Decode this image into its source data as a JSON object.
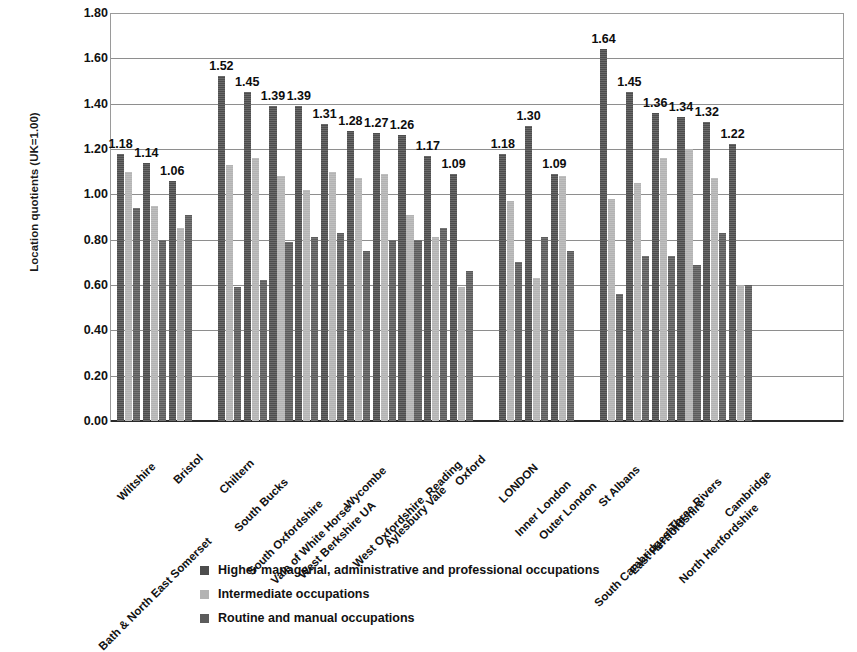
{
  "chart_data": {
    "type": "bar",
    "title": "",
    "xlabel": "",
    "ylabel": "Location quotients (UK=1.00)",
    "ylim": [
      0.0,
      1.8
    ],
    "ytick_labels": [
      "0.00",
      "0.20",
      "0.40",
      "0.60",
      "0.80",
      "1.00",
      "1.20",
      "1.40",
      "1.60",
      "1.80"
    ],
    "ytick_values": [
      0.0,
      0.2,
      0.4,
      0.6,
      0.8,
      1.0,
      1.2,
      1.4,
      1.6,
      1.8
    ],
    "grid": true,
    "legend_position": "bottom",
    "data_labels_series": "Higher managerial, administrative and professional occupations",
    "categories": [
      "Wiltshire",
      "Bath & North East Somerset",
      "Bristol",
      "Chiltern",
      "South Bucks",
      "South Oxfordshire",
      "Vale of White Horse",
      "West Berkshire UA",
      "Wycombe",
      "West Oxfordshire",
      "Aylesbury Vale",
      "Reading",
      "Oxford",
      "LONDON",
      "Inner London",
      "Outer London",
      "St Albans",
      "South Cambridgeshire",
      "East Hertfordshire",
      "Three Rivers",
      "North Hertfordshire",
      "Cambridge"
    ],
    "group_breaks_after": [
      2,
      12,
      15
    ],
    "series": [
      {
        "name": "Higher managerial, administrative and professional occupations",
        "color": "#4d4d4d",
        "values": [
          1.18,
          1.14,
          1.06,
          1.52,
          1.45,
          1.39,
          1.39,
          1.31,
          1.28,
          1.27,
          1.26,
          1.17,
          1.09,
          1.18,
          1.3,
          1.09,
          1.64,
          1.45,
          1.36,
          1.34,
          1.32,
          1.22
        ],
        "labels": [
          "1.18",
          "1.14",
          "1.06",
          "1.52",
          "1.45",
          "1.39",
          "1.39",
          "1.31",
          "1.28",
          "1.27",
          "1.26",
          "1.17",
          "1.09",
          "1.18",
          "1.30",
          "1.09",
          "1.64",
          "1.45",
          "1.36",
          "1.34",
          "1.32",
          "1.22"
        ]
      },
      {
        "name": "Intermediate occupations",
        "color": "#b3b3b3",
        "values": [
          1.1,
          0.95,
          0.85,
          1.13,
          1.16,
          1.08,
          1.02,
          1.1,
          1.07,
          1.09,
          0.91,
          0.81,
          0.59,
          0.97,
          0.63,
          1.08,
          0.98,
          1.05,
          1.16,
          1.2,
          1.07,
          0.6
        ]
      },
      {
        "name": "Routine and manual occupations",
        "color": "#5c5c5c",
        "values": [
          0.94,
          0.8,
          0.91,
          0.59,
          0.62,
          0.79,
          0.81,
          0.83,
          0.75,
          0.8,
          0.8,
          0.85,
          0.66,
          0.7,
          0.81,
          0.75,
          0.56,
          0.73,
          0.73,
          0.69,
          0.83,
          0.6
        ]
      }
    ]
  },
  "legend": {
    "items": [
      "Higher managerial, administrative and professional occupations",
      "Intermediate occupations",
      "Routine and manual occupations"
    ]
  }
}
